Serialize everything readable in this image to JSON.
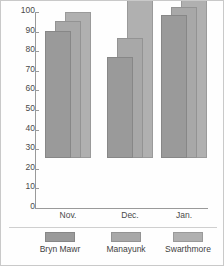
{
  "chart_data": {
    "type": "bar",
    "title": "",
    "subtitle": "",
    "xlabel": "",
    "ylabel": "",
    "categories": [
      "Nov.",
      "Dec.",
      "Jan."
    ],
    "series": [
      {
        "name": "Bryn Mawr",
        "values": [
          65,
          51.5,
          73
        ],
        "color": "#9a9a9a",
        "depth": "front"
      },
      {
        "name": "Manayunk",
        "values": [
          70,
          61,
          77
        ],
        "color": "#a8a8a8",
        "depth": "middle"
      },
      {
        "name": "Swarthmore",
        "values": [
          74.5,
          83.5,
          81
        ],
        "color": "#b0b0b0",
        "depth": "back"
      }
    ],
    "ylim": [
      0,
      100
    ],
    "ytick_labels": [
      "100",
      "90",
      "80",
      "70",
      "60",
      "50",
      "40",
      "30",
      "20",
      "10",
      "0"
    ],
    "ytick_values": [
      100,
      90,
      80,
      70,
      60,
      50,
      40,
      30,
      20,
      10,
      0
    ],
    "grid": false,
    "legend_position": "bottom",
    "legend_entries": [
      "Bryn Mawr",
      "Manayunk",
      "Swarthmore"
    ]
  },
  "axis": {
    "y_labels": [
      "100",
      "90",
      "80",
      "70",
      "60",
      "50",
      "40",
      "30",
      "20",
      "10",
      "0"
    ],
    "x_labels": [
      "Nov.",
      "Dec.",
      "Jan."
    ]
  },
  "legend": {
    "items": [
      {
        "label": "Bryn Mawr",
        "color": "#9a9a9a"
      },
      {
        "label": "Manayunk",
        "color": "#a8a8a8"
      },
      {
        "label": "Swarthmore",
        "color": "#b0b0b0"
      }
    ]
  },
  "layout": {
    "axis_color": "#9a9a9a",
    "text_color": "#4a4a4a",
    "frame_color": "#c9c9c9",
    "background": "#fefefe"
  }
}
